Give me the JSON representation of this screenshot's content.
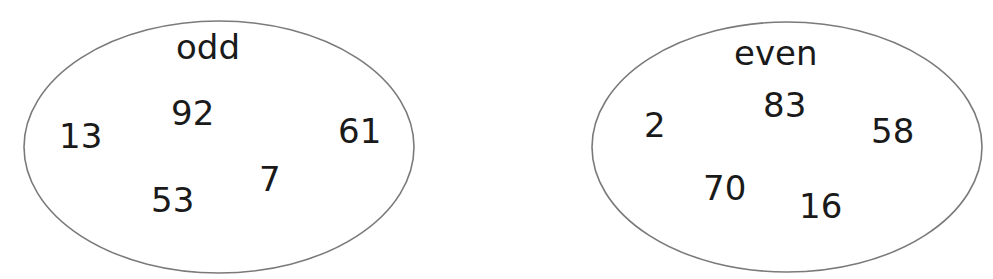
{
  "sets": [
    {
      "label": "odd",
      "numbers": [
        "13",
        "92",
        "61",
        "7",
        "53"
      ]
    },
    {
      "label": "even",
      "numbers": [
        "2",
        "83",
        "58",
        "70",
        "16"
      ]
    }
  ],
  "colors": {
    "outline": "#7a7a7a",
    "text": "#1a1a1a",
    "background": "#ffffff"
  }
}
